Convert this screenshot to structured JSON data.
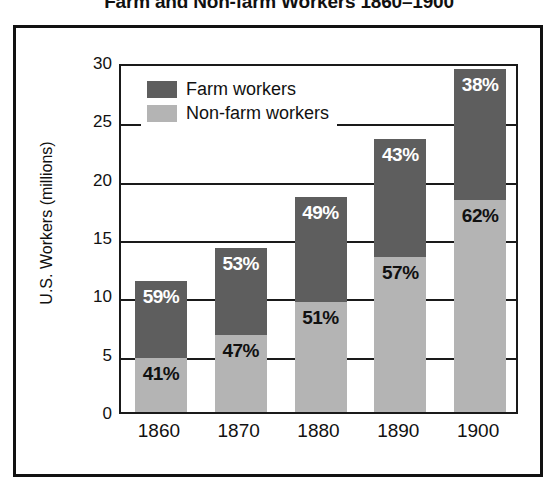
{
  "chart_data": {
    "type": "bar",
    "subtype": "stacked-bar",
    "title": "Farm and Non-farm Workers 1860–1900",
    "xlabel": "",
    "ylabel": "U.S. Workers (millions)",
    "ylim": [
      0,
      30
    ],
    "yticks": [
      0,
      5,
      10,
      15,
      20,
      25,
      30
    ],
    "ytick_labels": [
      "0",
      "5",
      "10",
      "15",
      "20",
      "25",
      "30"
    ],
    "grid": true,
    "legend_position": "top-left-inside",
    "categories": [
      "1860",
      "1870",
      "1880",
      "1890",
      "1900"
    ],
    "series": [
      {
        "name": "Non-farm workers",
        "color": "#b4b4b4",
        "stack_position": "bottom",
        "values": [
          4.6,
          6.6,
          9.4,
          13.3,
          18.2
        ],
        "percent_labels": [
          "41%",
          "47%",
          "51%",
          "57%",
          "62%"
        ],
        "label_color": "#111111"
      },
      {
        "name": "Farm workers",
        "color": "#5e5e5e",
        "stack_position": "top",
        "values": [
          6.6,
          7.5,
          9.0,
          10.1,
          11.2
        ],
        "percent_labels": [
          "59%",
          "53%",
          "49%",
          "43%",
          "38%"
        ],
        "label_color": "#ffffff"
      }
    ],
    "totals": [
      11.2,
      14.1,
      18.4,
      23.4,
      29.4
    ]
  },
  "legend": {
    "items": [
      {
        "label": "Farm workers",
        "swatch": "farm"
      },
      {
        "label": "Non-farm workers",
        "swatch": "nonfarm"
      }
    ]
  },
  "colors": {
    "farm": "#5e5e5e",
    "nonfarm": "#b4b4b4",
    "axis": "#1a1a1a",
    "frame": "#111111",
    "background": "#ffffff"
  }
}
